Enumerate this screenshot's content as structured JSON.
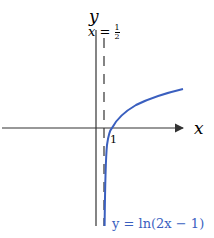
{
  "diagram": {
    "axes": {
      "x_label": "x",
      "y_label": "y"
    },
    "asymptote": {
      "label_lhs": "x",
      "label_eq": "=",
      "label_num": "1",
      "label_den": "2",
      "style": "dashed"
    },
    "intercept_label": "1",
    "curve": {
      "label": "y = ln(2x − 1)",
      "color": "#3a5fbf"
    },
    "colors": {
      "axis": "#333333",
      "curve": "#3a5fbf",
      "asymptote": "#333333"
    }
  }
}
